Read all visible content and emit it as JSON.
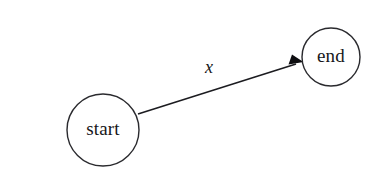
{
  "diagram": {
    "type": "state-transition-diagram",
    "background_color": "#ffffff",
    "stroke_color": "#2a2a2e",
    "text_color": "#17171a",
    "nodes": [
      {
        "id": "start",
        "label": "start",
        "shape": "circle",
        "cx": 103,
        "cy": 130,
        "r": 36
      },
      {
        "id": "end",
        "label": "end",
        "shape": "circle",
        "cx": 331,
        "cy": 57,
        "r": 29
      }
    ],
    "edges": [
      {
        "id": "start-to-end",
        "from": "start",
        "to": "end",
        "label": "x",
        "label_x": 209,
        "label_y": 69,
        "directed": true,
        "arrow_at": "end"
      }
    ]
  }
}
